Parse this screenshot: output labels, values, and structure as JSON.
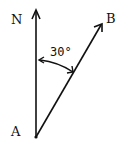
{
  "diagram": {
    "labels": {
      "north": "N",
      "start": "A",
      "end": "B",
      "angle": "30°"
    },
    "colors": {
      "stroke": "#111111",
      "background": "#ffffff"
    }
  }
}
